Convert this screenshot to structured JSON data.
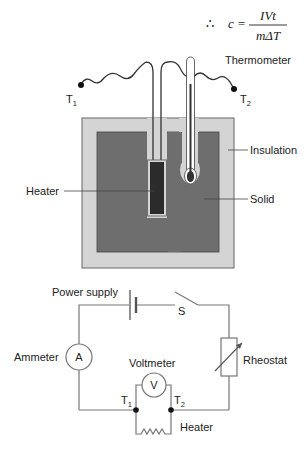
{
  "formula": {
    "therefore": "∴",
    "lhs": "c =",
    "numerator": "IVt",
    "denominator": "mΔT"
  },
  "apparatus": {
    "labels": {
      "thermometer": "Thermometer",
      "insulation": "Insulation",
      "solid": "Solid",
      "heater": "Heater",
      "terminal_1": "T",
      "terminal_1_sub": "1",
      "terminal_2": "T",
      "terminal_2_sub": "2"
    },
    "colors": {
      "insulation": "#d4d4d4",
      "solid": "#6e6e6e",
      "heater": "#2b2b2b",
      "thermometer_liquid": "#333333",
      "outline": "#555555"
    }
  },
  "circuit": {
    "labels": {
      "power_supply": "Power supply",
      "switch": "S",
      "ammeter": "Ammeter",
      "ammeter_symbol": "A",
      "voltmeter": "Voltmeter",
      "voltmeter_symbol": "V",
      "rheostat": "Rheostat",
      "heater": "Heater",
      "node_1": "T",
      "node_1_sub": "1",
      "node_2": "T",
      "node_2_sub": "2"
    },
    "colors": {
      "wire": "#777777",
      "node": "#111111"
    }
  }
}
